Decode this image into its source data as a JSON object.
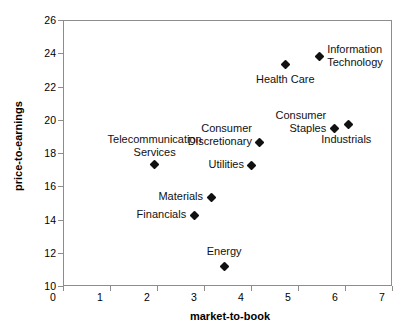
{
  "chart_data": {
    "type": "scatter",
    "title": "",
    "xlabel": "market-to-book",
    "ylabel": "price-to-earnings",
    "xlim": [
      0,
      7
    ],
    "ylim": [
      10,
      26
    ],
    "xticks": [
      "0",
      "1",
      "2",
      "3",
      "4",
      "5",
      "6",
      "7"
    ],
    "yticks": [
      "10",
      "12",
      "14",
      "16",
      "18",
      "20",
      "22",
      "24",
      "26"
    ],
    "grid": false,
    "legend": "none",
    "marker": "diamond",
    "marker_color": "#111111",
    "points": [
      {
        "label": "Telecommunication\nServices",
        "x": 1.95,
        "y": 17.3,
        "label_pos": "above",
        "label_dx": 0,
        "label_dy": -32
      },
      {
        "label": "Health Care",
        "x": 4.73,
        "y": 23.3,
        "label_pos": "below",
        "label_dx": 0,
        "label_dy": 8
      },
      {
        "label": "Information\nTechnology",
        "x": 5.45,
        "y": 23.8,
        "label_pos": "right",
        "label_dx": 8,
        "label_dy": -14
      },
      {
        "label": "Consumer\nStaples",
        "x": 5.77,
        "y": 19.45,
        "label_pos": "left",
        "label_dx": -8,
        "label_dy": -20
      },
      {
        "label": "Industrials",
        "x": 6.07,
        "y": 19.7,
        "label_pos": "below-right",
        "label_dx": -2,
        "label_dy": 8
      },
      {
        "label": "Consumer\nDiscretionary",
        "x": 4.19,
        "y": 18.65,
        "label_pos": "left",
        "label_dx": -8,
        "label_dy": -20
      },
      {
        "label": "Utilities",
        "x": 4.02,
        "y": 17.25,
        "label_pos": "left",
        "label_dx": -8,
        "label_dy": -7
      },
      {
        "label": "Materials",
        "x": 3.15,
        "y": 15.35,
        "label_pos": "left",
        "label_dx": -8,
        "label_dy": -7
      },
      {
        "label": "Financials",
        "x": 2.79,
        "y": 14.25,
        "label_pos": "left",
        "label_dx": -8,
        "label_dy": -7
      },
      {
        "label": "Energy",
        "x": 3.43,
        "y": 11.2,
        "label_pos": "above",
        "label_dx": 0,
        "label_dy": -21
      }
    ]
  }
}
